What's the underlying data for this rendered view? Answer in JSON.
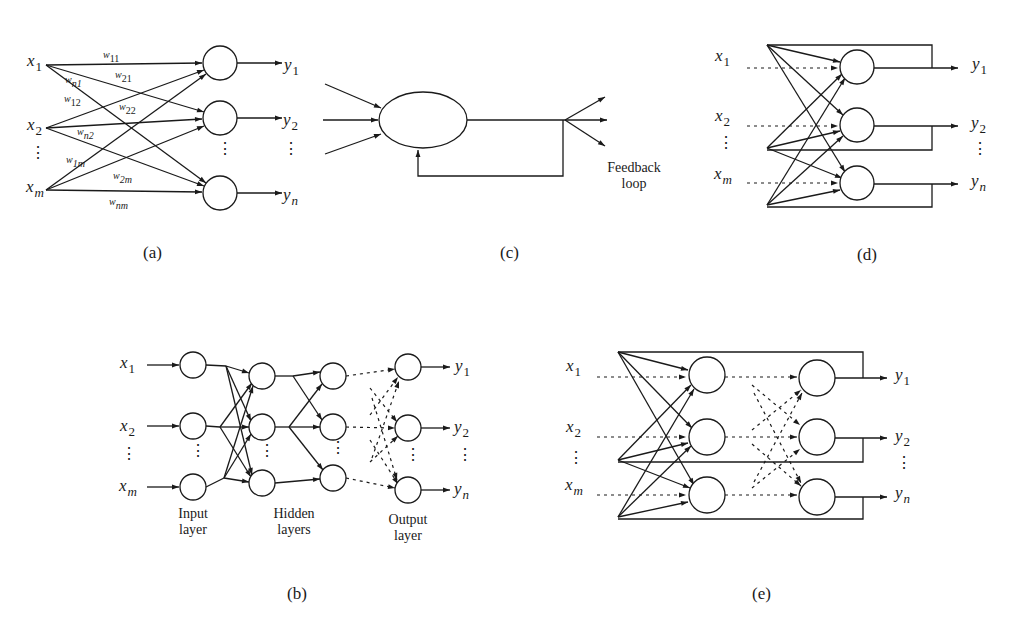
{
  "figure": {
    "panels": [
      {
        "id": "a",
        "caption": "(a)",
        "description": "Single-layer feedforward network",
        "inputs": [
          {
            "base": "x",
            "sub": "1"
          },
          {
            "base": "x",
            "sub": "2"
          },
          {
            "base": "x",
            "sub": "m"
          }
        ],
        "outputs": [
          {
            "base": "y",
            "sub": "1"
          },
          {
            "base": "y",
            "sub": "2"
          },
          {
            "base": "y",
            "sub": "n"
          }
        ],
        "weights": [
          {
            "base": "w",
            "sub": "11"
          },
          {
            "base": "w",
            "sub": "21"
          },
          {
            "base": "w",
            "sub": "n1"
          },
          {
            "base": "w",
            "sub": "12"
          },
          {
            "base": "w",
            "sub": "22"
          },
          {
            "base": "w",
            "sub": "n2"
          },
          {
            "base": "w",
            "sub": "1m"
          },
          {
            "base": "w",
            "sub": "2m"
          },
          {
            "base": "w",
            "sub": "nm"
          }
        ],
        "ellipsis": "⋮"
      },
      {
        "id": "b",
        "caption": "(b)",
        "description": "Multilayer feedforward network",
        "inputs": [
          {
            "base": "x",
            "sub": "1"
          },
          {
            "base": "x",
            "sub": "2"
          },
          {
            "base": "x",
            "sub": "m"
          }
        ],
        "outputs": [
          {
            "base": "y",
            "sub": "1"
          },
          {
            "base": "y",
            "sub": "2"
          },
          {
            "base": "y",
            "sub": "n"
          }
        ],
        "layer_labels": {
          "input": [
            "Input",
            "layer"
          ],
          "hidden": [
            "Hidden",
            "layers"
          ],
          "output": [
            "Output",
            "layer"
          ]
        },
        "ellipsis": "⋮"
      },
      {
        "id": "c",
        "caption": "(c)",
        "description": "Single node with feedback to itself",
        "note": [
          "Feedback",
          "loop"
        ]
      },
      {
        "id": "d",
        "caption": "(d)",
        "description": "Single-layer recurrent network",
        "inputs": [
          {
            "base": "x",
            "sub": "1"
          },
          {
            "base": "x",
            "sub": "2"
          },
          {
            "base": "x",
            "sub": "m"
          }
        ],
        "outputs": [
          {
            "base": "y",
            "sub": "1"
          },
          {
            "base": "y",
            "sub": "2"
          },
          {
            "base": "y",
            "sub": "n"
          }
        ],
        "ellipsis": "⋮"
      },
      {
        "id": "e",
        "caption": "(e)",
        "description": "Multilayer recurrent network",
        "inputs": [
          {
            "base": "x",
            "sub": "1"
          },
          {
            "base": "x",
            "sub": "2"
          },
          {
            "base": "x",
            "sub": "m"
          }
        ],
        "outputs": [
          {
            "base": "y",
            "sub": "1"
          },
          {
            "base": "y",
            "sub": "2"
          },
          {
            "base": "y",
            "sub": "n"
          }
        ],
        "ellipsis": "⋮"
      }
    ]
  },
  "colors": {
    "ink": "#1a1a1a",
    "background": "#ffffff"
  }
}
